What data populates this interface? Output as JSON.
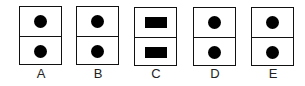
{
  "options": [
    {
      "label": "A",
      "shape": "circle",
      "left": 19
    },
    {
      "label": "B",
      "shape": "circle",
      "left": 76
    },
    {
      "label": "C",
      "shape": "rectangle",
      "left": 134
    },
    {
      "label": "D",
      "shape": "circle",
      "left": 193
    },
    {
      "label": "E",
      "shape": "circle",
      "left": 251
    }
  ],
  "colors": {
    "stroke": "#111111",
    "fill": "#000000",
    "background": "#ffffff"
  }
}
